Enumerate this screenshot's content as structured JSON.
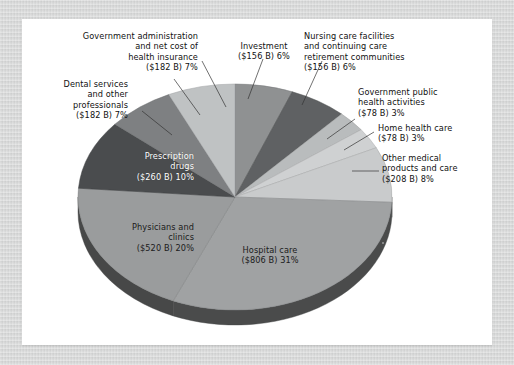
{
  "page": {
    "background_color": "#d5d6d6",
    "card_color": "#ffffff"
  },
  "chart_data": {
    "type": "pie",
    "title": "",
    "subtitle": "",
    "xlabel": "",
    "ylabel": "",
    "legend_position": "none",
    "grid": false,
    "units": "billions of dollars",
    "total_percent": 100,
    "categories": [
      "Investment",
      "Nursing care facilities and continuing care retirement communities",
      "Government public health activities",
      "Home health care",
      "Other medical products and care",
      "Hospital care",
      "Physicians and clinics",
      "Prescription drugs",
      "Dental services and other professionals",
      "Government administration and net cost of health insurance"
    ],
    "values": [
      156,
      156,
      78,
      78,
      208,
      806,
      520,
      260,
      182,
      182
    ],
    "percents": [
      6,
      6,
      3,
      3,
      8,
      31,
      20,
      10,
      7,
      7
    ],
    "colors": [
      "#8f9192",
      "#5f6163",
      "#b9bcbd",
      "#cfd1d2",
      "#c9cbcc",
      "#a0a2a3",
      "#9a9c9d",
      "#4a4c4e",
      "#7e8082",
      "#bfc2c3"
    ],
    "slices": [
      {
        "name": "Investment",
        "label_line1": "Investment",
        "label_line2": "($156 B) 6%",
        "value": 156,
        "percent": 6,
        "color": "#8f9192"
      },
      {
        "name": "Nursing care facilities and continuing care retirement communities",
        "label_line1": "Nursing care facilities",
        "label_line2": "and continuing care",
        "label_line3": "retirement communities",
        "label_line4": "($156 B) 6%",
        "value": 156,
        "percent": 6,
        "color": "#5f6163"
      },
      {
        "name": "Government public health activities",
        "label_line1": "Government public",
        "label_line2": "health activities",
        "label_line3": "($78 B) 3%",
        "value": 78,
        "percent": 3,
        "color": "#b9bcbd"
      },
      {
        "name": "Home health care",
        "label_line1": "Home health care",
        "label_line2": "($78 B) 3%",
        "value": 78,
        "percent": 3,
        "color": "#cfd1d2"
      },
      {
        "name": "Other medical products and care",
        "label_line1": "Other medical",
        "label_line2": "products and care",
        "label_line3": "($208 B) 8%",
        "value": 208,
        "percent": 8,
        "color": "#c9cbcc"
      },
      {
        "name": "Hospital care",
        "label_line1": "Hospital care",
        "label_line2": "($806 B) 31%",
        "value": 806,
        "percent": 31,
        "color": "#a0a2a3"
      },
      {
        "name": "Physicians and clinics",
        "label_line1": "Physicians and",
        "label_line2": "clinics",
        "label_line3": "($520 B) 20%",
        "value": 520,
        "percent": 20,
        "color": "#9a9c9d"
      },
      {
        "name": "Prescription drugs",
        "label_line1": "Prescription",
        "label_line2": "drugs",
        "label_line3": "($260 B) 10%",
        "value": 260,
        "percent": 10,
        "color": "#4a4c4e"
      },
      {
        "name": "Dental services and other professionals",
        "label_line1": "Dental services",
        "label_line2": "and other",
        "label_line3": "professionals",
        "label_line4": "($182 B) 7%",
        "value": 182,
        "percent": 7,
        "color": "#7e8082"
      },
      {
        "name": "Government administration and net cost of health insurance",
        "label_line1": "Government administration",
        "label_line2": "and net cost of",
        "label_line3": "health insurance",
        "label_line4": "($182 B) 7%",
        "value": 182,
        "percent": 7,
        "color": "#bfc2c3"
      }
    ]
  },
  "labels": {
    "gov_admin": "Government administration\nand net cost of\nhealth insurance\n($182 B) 7%",
    "investment": "Investment\n($156 B) 6%",
    "nursing": "Nursing care facilities\nand continuing care\nretirement communities\n($156 B) 6%",
    "dental": "Dental services\nand other\nprofessionals\n($182 B) 7%",
    "gov_public_health": "Government public\nhealth activities\n($78 B) 3%",
    "home_health": "Home health care\n($78 B) 3%",
    "other_medical": "Other medical\nproducts and care\n($208 B) 8%",
    "prescription": "Prescription\ndrugs\n($260 B) 10%",
    "physicians": "Physicians and\nclinics\n($520 B) 20%",
    "hospital": "Hospital care\n($806 B) 31%"
  }
}
